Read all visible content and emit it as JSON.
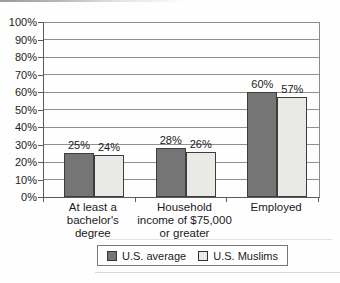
{
  "chart_data": {
    "type": "bar",
    "categories": [
      "At least a bachelor's degree",
      "Household income of $75,000 or greater",
      "Employed"
    ],
    "category_lines": [
      [
        "At least a",
        "bachelor's",
        "degree"
      ],
      [
        "Household",
        "income of $75,000",
        "or greater"
      ],
      [
        "Employed"
      ]
    ],
    "series": [
      {
        "name": "U.S. average",
        "values": [
          25,
          28,
          60
        ],
        "color": "#757575"
      },
      {
        "name": "U.S. Muslims",
        "values": [
          24,
          26,
          57
        ],
        "color": "#e9e9e6"
      }
    ],
    "value_labels": [
      [
        "25%",
        "28%",
        "60%"
      ],
      [
        "24%",
        "26%",
        "57%"
      ]
    ],
    "ytick_labels": [
      "0%",
      "10%",
      "20%",
      "30%",
      "40%",
      "50%",
      "60%",
      "70%",
      "80%",
      "90%",
      "100%"
    ],
    "ylim": [
      0,
      100
    ],
    "ytick_step": 10,
    "grid": true,
    "legend_position": "bottom",
    "title": "",
    "xlabel": "",
    "ylabel": "",
    "colors": {
      "grid": "#8f8f8f",
      "axis": "#5a5a5a",
      "bar_border": "#3d3d3d",
      "text": "#1a1a1a"
    }
  }
}
